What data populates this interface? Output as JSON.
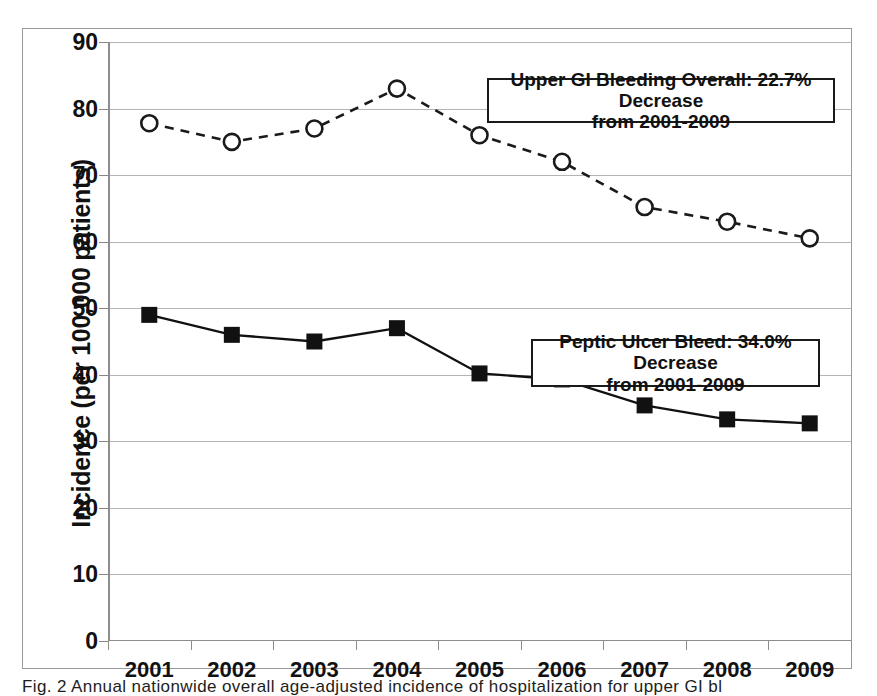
{
  "chart_data": {
    "type": "line",
    "title": "",
    "xlabel": "",
    "ylabel": "Incidence (per 100,000 patients)",
    "categories": [
      "2001",
      "2002",
      "2003",
      "2004",
      "2005",
      "2006",
      "2007",
      "2008",
      "2009"
    ],
    "ylim": [
      0,
      90
    ],
    "ytick_step": 10,
    "yticks": [
      "0",
      "10",
      "20",
      "30",
      "40",
      "50",
      "60",
      "70",
      "80",
      "90"
    ],
    "grid": "horizontal",
    "legend_position": "none",
    "series": [
      {
        "name": "Upper GI Bleeding Overall",
        "values": [
          77.8,
          75.0,
          77.0,
          83.0,
          76.0,
          72.0,
          65.2,
          63.0,
          60.5
        ],
        "line_style": "dashed",
        "marker": "open-circle",
        "color": "#1a1a1a"
      },
      {
        "name": "Peptic Ulcer Bleed",
        "values": [
          49.0,
          46.0,
          45.0,
          47.0,
          40.2,
          39.3,
          35.4,
          33.3,
          32.7
        ],
        "line_style": "solid",
        "marker": "filled-square",
        "color": "#111111"
      }
    ],
    "annotations": [
      {
        "id": "upper-gi",
        "line1": "Upper GI Bleeding Overall: 22.7% Decrease",
        "line2": "from 2001-2009"
      },
      {
        "id": "peptic-ulcer",
        "line1": "Peptic Ulcer Bleed: 34.0% Decrease",
        "line2": "from 2001-2009"
      }
    ]
  },
  "caption": "Fig. 2   Annual nationwide overall age-adjusted incidence of hospitalization for upper GI bl"
}
